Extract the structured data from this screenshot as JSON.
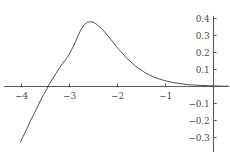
{
  "chart_data": {
    "type": "line",
    "title": "",
    "subtitle": "",
    "xlabel": "",
    "ylabel": "",
    "xlim": [
      -4.45,
      0.35
    ],
    "ylim": [
      -0.36,
      0.43
    ],
    "grid": false,
    "legend": null,
    "axes": {
      "x_axis_at_y": 0,
      "y_axis_at_x": 0,
      "axis_color": "#595959",
      "tick_direction": "out"
    },
    "xticks": [
      {
        "value": -4,
        "label": "−4"
      },
      {
        "value": -3,
        "label": "−3"
      },
      {
        "value": -2,
        "label": "−2"
      },
      {
        "value": -1,
        "label": "−1"
      }
    ],
    "yticks": [
      {
        "value": 0.4,
        "label": "0.4"
      },
      {
        "value": 0.3,
        "label": "0.3"
      },
      {
        "value": 0.2,
        "label": "0.2"
      },
      {
        "value": 0.1,
        "label": "0.1"
      },
      {
        "value": -0.1,
        "label": "−0.1"
      },
      {
        "value": -0.2,
        "label": "−0.2"
      },
      {
        "value": -0.3,
        "label": "−0.3"
      }
    ],
    "series": [
      {
        "name": "curve",
        "color": "#4d4d4d",
        "line_width": 1,
        "x": [
          -4.02,
          -3.95,
          -3.88,
          -3.82,
          -3.75,
          -3.68,
          -3.62,
          -3.55,
          -3.48,
          -3.42,
          -3.35,
          -3.28,
          -3.22,
          -3.15,
          -3.08,
          -3.02,
          -2.95,
          -2.88,
          -2.82,
          -2.75,
          -2.68,
          -2.62,
          -2.55,
          -2.48,
          -2.42,
          -2.35,
          -2.28,
          -2.22,
          -2.15,
          -2.08,
          -2.02,
          -1.95,
          -1.88,
          -1.82,
          -1.75,
          -1.68,
          -1.62,
          -1.55,
          -1.48,
          -1.42,
          -1.35,
          -1.28,
          -1.22,
          -1.15,
          -1.08,
          -1.02,
          -0.95,
          -0.88,
          -0.82,
          -0.75,
          -0.68,
          -0.62,
          -0.55,
          -0.48,
          -0.42,
          -0.35,
          -0.28,
          -0.22,
          -0.15,
          -0.08,
          0.0,
          0.08,
          0.2,
          0.32
        ],
        "y": [
          -0.325,
          -0.285,
          -0.245,
          -0.206,
          -0.167,
          -0.128,
          -0.091,
          -0.054,
          -0.019,
          0.014,
          0.046,
          0.077,
          0.105,
          0.132,
          0.158,
          0.182,
          0.22,
          0.26,
          0.3,
          0.34,
          0.366,
          0.378,
          0.38,
          0.375,
          0.362,
          0.345,
          0.325,
          0.303,
          0.28,
          0.257,
          0.234,
          0.212,
          0.19,
          0.17,
          0.152,
          0.135,
          0.119,
          0.105,
          0.092,
          0.08,
          0.07,
          0.061,
          0.053,
          0.046,
          0.04,
          0.035,
          0.03,
          0.026,
          0.022,
          0.019,
          0.016,
          0.014,
          0.012,
          0.01,
          0.009,
          0.008,
          0.007,
          0.006,
          0.005,
          0.004,
          0.004,
          0.003,
          0.002,
          0.002
        ]
      }
    ],
    "annotations": [],
    "peak": {
      "x": -2.55,
      "y": 0.38
    },
    "zero_crossing": {
      "x": -3.47,
      "y": 0
    },
    "min_visible": {
      "x": -4.02,
      "y": -0.325
    }
  }
}
